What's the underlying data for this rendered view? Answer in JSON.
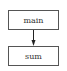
{
  "diagram": {
    "type": "call-graph",
    "nodes": [
      {
        "id": "main",
        "label": "main"
      },
      {
        "id": "sum",
        "label": "sum"
      }
    ],
    "edges": [
      {
        "from": "main",
        "to": "sum"
      }
    ],
    "colors": {
      "node_border": "#555555",
      "edge": "#222222",
      "text": "#333333",
      "background": "#ffffff"
    }
  }
}
